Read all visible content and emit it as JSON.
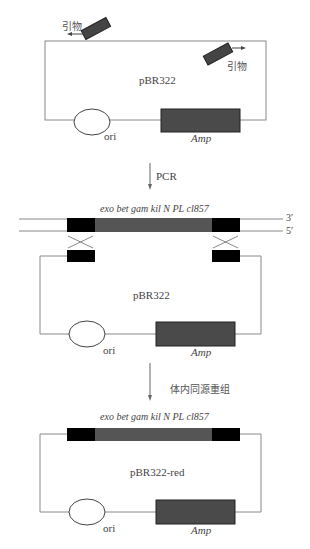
{
  "panel1": {
    "plasmid_label": "pBR322",
    "primer_left_label": "引物",
    "primer_right_label": "引物",
    "ori_label": "ori",
    "amp_label": "Amp"
  },
  "step1": {
    "label": "PCR"
  },
  "panel2": {
    "insert_label": "exo bet gam kil N PL cl857",
    "strand_top_label": "3′",
    "strand_bottom_label": "5′",
    "plasmid_label": "pBR322",
    "ori_label": "ori",
    "amp_label": "Amp"
  },
  "step2": {
    "label": "体内同源重组"
  },
  "panel3": {
    "insert_label": "exo bet gam kil N PL cl857",
    "plasmid_label": "pBR322-red",
    "ori_label": "ori",
    "amp_label": "Amp"
  },
  "colors": {
    "line": "#888888",
    "block_dark": "#000000",
    "block_gray": "#4a4a4a"
  }
}
